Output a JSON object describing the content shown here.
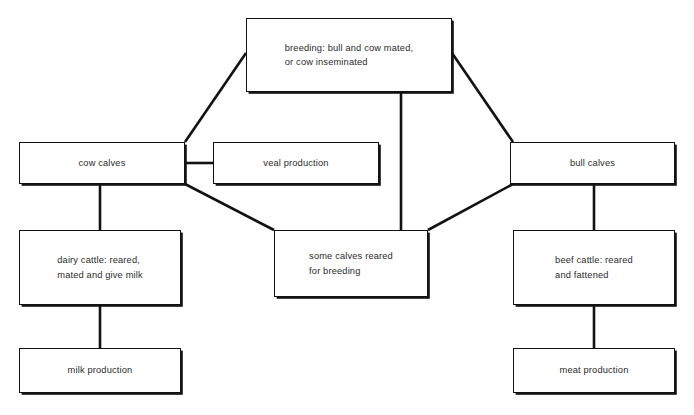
{
  "diagram": {
    "background_color": "#ffffff",
    "line_color": "#121212",
    "text_color": "#2b2b2b",
    "nodes": [
      {
        "id": "breeding",
        "label": "breeding: bull and cow mated,\nor cow inseminated",
        "align": "left",
        "x": 246,
        "y": 18,
        "w": 206,
        "h": 74
      },
      {
        "id": "cow-calves",
        "label": "cow calves",
        "align": "center",
        "x": 19,
        "y": 142,
        "w": 166,
        "h": 42
      },
      {
        "id": "veal-production",
        "label": "veal production",
        "align": "center",
        "x": 213,
        "y": 142,
        "w": 166,
        "h": 42
      },
      {
        "id": "bull-calves",
        "label": "bull calves",
        "align": "center",
        "x": 510,
        "y": 142,
        "w": 165,
        "h": 42
      },
      {
        "id": "dairy-cattle",
        "label": "dairy cattle: reared,\nmated and give milk",
        "align": "left",
        "x": 19,
        "y": 230,
        "w": 162,
        "h": 75
      },
      {
        "id": "some-calves",
        "label": "some calves reared\nfor breeding",
        "align": "left",
        "x": 274,
        "y": 230,
        "w": 154,
        "h": 67
      },
      {
        "id": "beef-cattle",
        "label": "beef cattle: reared\nand fattened",
        "align": "left",
        "x": 513,
        "y": 230,
        "w": 162,
        "h": 75
      },
      {
        "id": "milk-production",
        "label": "milk production",
        "align": "center",
        "x": 19,
        "y": 348,
        "w": 162,
        "h": 45
      },
      {
        "id": "meat-production",
        "label": "meat production",
        "align": "center",
        "x": 513,
        "y": 348,
        "w": 162,
        "h": 45
      }
    ],
    "connectors": [
      {
        "id": "breeding-to-cow-calves",
        "from": "breeding",
        "to": "cow-calves",
        "kind": "diagonal",
        "points": "246,53 185,142"
      },
      {
        "id": "breeding-to-bull-calves",
        "from": "breeding",
        "to": "bull-calves",
        "kind": "diagonal",
        "points": "452,53 513,142"
      },
      {
        "id": "breeding-to-some-calves",
        "from": "breeding",
        "to": "some-calves",
        "kind": "vertical",
        "points": "401,92 401,230"
      },
      {
        "id": "cow-calves-to-veal",
        "from": "cow-calves",
        "to": "veal-production",
        "kind": "horizontal",
        "points": "185,163 213,163"
      },
      {
        "id": "cow-calves-to-dairy",
        "from": "cow-calves",
        "to": "dairy-cattle",
        "kind": "vertical",
        "points": "100,184 100,230"
      },
      {
        "id": "cow-calves-to-some-calves",
        "from": "cow-calves",
        "to": "some-calves",
        "kind": "diagonal",
        "points": "185,184 274,230"
      },
      {
        "id": "bull-calves-to-some-calves",
        "from": "bull-calves",
        "to": "some-calves",
        "kind": "diagonal",
        "points": "513,184 428,230"
      },
      {
        "id": "bull-calves-to-beef",
        "from": "bull-calves",
        "to": "beef-cattle",
        "kind": "vertical",
        "points": "594,184 594,230"
      },
      {
        "id": "dairy-to-milk",
        "from": "dairy-cattle",
        "to": "milk-production",
        "kind": "vertical",
        "points": "100,305 100,348"
      },
      {
        "id": "beef-to-meat",
        "from": "beef-cattle",
        "to": "meat-production",
        "kind": "vertical",
        "points": "594,305 594,348"
      }
    ]
  }
}
